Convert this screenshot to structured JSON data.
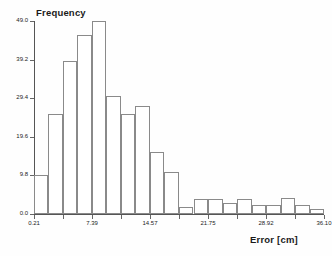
{
  "chart_data": {
    "type": "bar",
    "title": "",
    "xlabel": "Error [cm]",
    "ylabel": "Frequency",
    "grid": false,
    "legend": false,
    "xlim": [
      0.21,
      36.1
    ],
    "ylim": [
      0.0,
      49.0
    ],
    "bin_width": 1.7945,
    "x_tick_labels": [
      "0.21",
      "3.80",
      "7.39",
      "10.98",
      "14.57",
      "18.16",
      "21.75",
      "25.34",
      "28.92",
      "32.51",
      "36.10"
    ],
    "x_tick_values": [
      0.21,
      3.8,
      7.39,
      10.98,
      14.57,
      18.16,
      21.75,
      25.34,
      28.92,
      32.51,
      36.1
    ],
    "y_tick_labels": [
      "0.0",
      "9.8",
      "19.6",
      "29.4",
      "39.2",
      "49.0"
    ],
    "y_tick_values": [
      0.0,
      9.8,
      19.6,
      29.4,
      39.2,
      49.0
    ],
    "bin_edges": [
      0.21,
      2.0,
      3.8,
      5.59,
      7.39,
      9.18,
      10.98,
      12.77,
      14.57,
      16.36,
      18.16,
      19.95,
      21.75,
      23.54,
      25.34,
      27.13,
      28.92,
      30.72,
      32.51,
      34.31,
      36.1
    ],
    "categories": [
      "0.21-2.00",
      "2.00-3.80",
      "3.80-5.59",
      "5.59-7.39",
      "7.39-9.18",
      "9.18-10.98",
      "10.98-12.77",
      "12.77-14.57",
      "14.57-16.36",
      "16.36-18.16",
      "18.16-19.95",
      "19.95-21.75",
      "21.75-23.54",
      "23.54-25.34",
      "25.34-27.13",
      "27.13-28.92",
      "28.92-30.72",
      "30.72-32.51",
      "32.51-34.31",
      "34.31-36.10"
    ],
    "values": [
      9.8,
      25.4,
      38.8,
      45.5,
      49.0,
      30.0,
      25.4,
      27.3,
      15.8,
      10.6,
      1.9,
      3.9,
      3.9,
      2.9,
      3.9,
      2.4,
      2.4,
      4.0,
      2.4,
      1.2
    ]
  }
}
